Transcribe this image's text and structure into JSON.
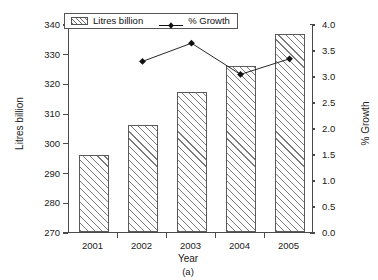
{
  "chart_data": {
    "type": "bar",
    "title": "",
    "caption": "(a)",
    "xlabel": "Year",
    "ylabel": "Litres billion",
    "ylabel_right": "% Growth",
    "categories": [
      "2001",
      "2002",
      "2003",
      "2004",
      "2005"
    ],
    "ylim": [
      270,
      340
    ],
    "yticks": [
      "270",
      "280",
      "290",
      "300",
      "310",
      "320",
      "330",
      "340"
    ],
    "ylim_right": [
      0.0,
      4.0
    ],
    "yticks_right": [
      "0.0",
      "0.5",
      "1.0",
      "1.5",
      "2.0",
      "2.5",
      "3.0",
      "3.5",
      "4.0"
    ],
    "grid": false,
    "legend_position": "top-left",
    "series": [
      {
        "name": "Litres billion",
        "type": "bar",
        "axis": "left",
        "marker": "hatched-box",
        "values": [
          296.0,
          306.0,
          317.0,
          326.0,
          336.5
        ]
      },
      {
        "name": "% Growth",
        "type": "line",
        "axis": "right",
        "marker": "diamond",
        "values": [
          null,
          3.3,
          3.65,
          3.05,
          3.35
        ]
      }
    ]
  },
  "legend": {
    "items": [
      {
        "label": "Litres billion",
        "marker": "hatched-box"
      },
      {
        "label": "% Growth",
        "marker": "line-diamond"
      }
    ]
  }
}
